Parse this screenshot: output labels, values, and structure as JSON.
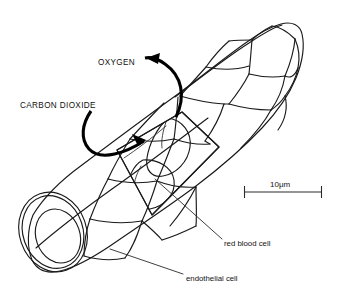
{
  "figure": {
    "background_color": "#ffffff",
    "ink_color": "#1a1a1a"
  },
  "labels": {
    "oxygen": "OXYGEN",
    "carbon_dioxide": "CARBON DIOXIDE",
    "red_blood_cell": "red blood cell",
    "endothelial_cell": "endothelial cell"
  },
  "scale_bar": {
    "text": "10μm",
    "length_value": 10,
    "unit": "μm"
  },
  "annotations": {
    "oxygen_direction": "arrow curving out of the capillary toward upper left",
    "carbon_dioxide_direction": "arrow curving into the capillary toward the red blood cells"
  },
  "structures": {
    "capillary_tube": "endothelial tube shown in oblique view, cut open at midsection",
    "cut_window": "stippled cutaway window exposing two red blood cells",
    "cross_section": "open circular end showing stippled vessel wall and lumen",
    "red_blood_cells_count": 2
  }
}
